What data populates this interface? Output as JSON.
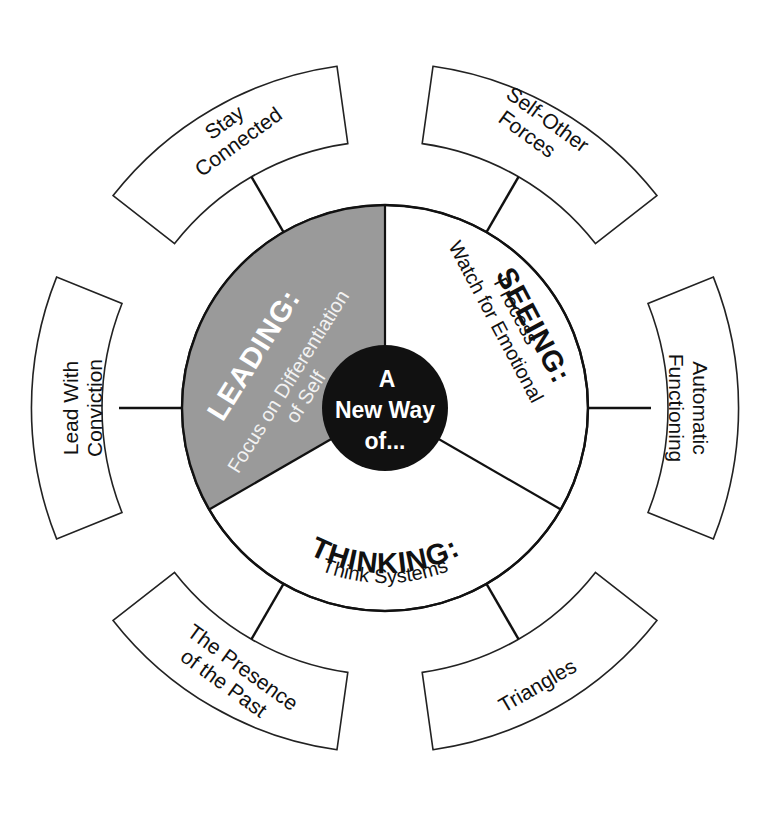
{
  "diagram": {
    "center": {
      "lines": [
        "A",
        "New Way",
        "of..."
      ],
      "fill_color": "#111111",
      "text_color": "#ffffff"
    },
    "sectors": [
      {
        "id": "leading",
        "heading": "LEADING:",
        "subtitle_lines": [
          "Focus on Differentiation",
          "of Self"
        ],
        "fill_color": "#9a9a9a"
      },
      {
        "id": "seeing",
        "heading": "SEEING:",
        "subtitle_lines": [
          "Watch for Emotional",
          "Process"
        ],
        "fill_color": "#ffffff"
      },
      {
        "id": "thinking",
        "heading": "THINKING:",
        "subtitle_lines": [
          "Think Systems"
        ],
        "fill_color": "#ffffff"
      }
    ],
    "outer_boxes": [
      {
        "id": "stay-connected",
        "lines": [
          "Stay",
          "Connected"
        ]
      },
      {
        "id": "self-other-forces",
        "lines": [
          "Self-Other",
          "Forces"
        ]
      },
      {
        "id": "automatic-functioning",
        "lines": [
          "Automatic",
          "Functioning"
        ]
      },
      {
        "id": "triangles",
        "lines": [
          "Triangles"
        ]
      },
      {
        "id": "presence-of-the-past",
        "lines": [
          "The Presence",
          "of the Past"
        ]
      },
      {
        "id": "lead-with-conviction",
        "lines": [
          "Lead With",
          "Conviction"
        ]
      }
    ]
  }
}
